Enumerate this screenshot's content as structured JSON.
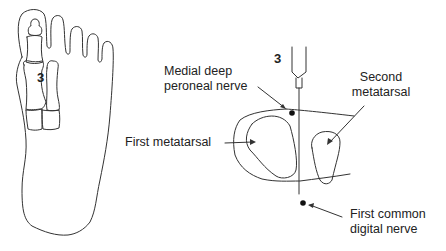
{
  "figure": {
    "left_panel": {
      "marker": "3",
      "description": "plantar outline of the foot with first and second ray bones"
    },
    "right_panel": {
      "marker": "3",
      "labels": {
        "medial_deep_peroneal_nerve_line1": "Medial deep",
        "medial_deep_peroneal_nerve_line2": "peroneal nerve",
        "second_metatarsal_line1": "Second",
        "second_metatarsal_line2": "metatarsal",
        "first_metatarsal": "First metatarsal",
        "first_common_digital_nerve_line1": "First common",
        "first_common_digital_nerve_line2": "digital nerve"
      }
    },
    "colors": {
      "line": "#333333",
      "text": "#222222",
      "background": "#ffffff"
    }
  }
}
